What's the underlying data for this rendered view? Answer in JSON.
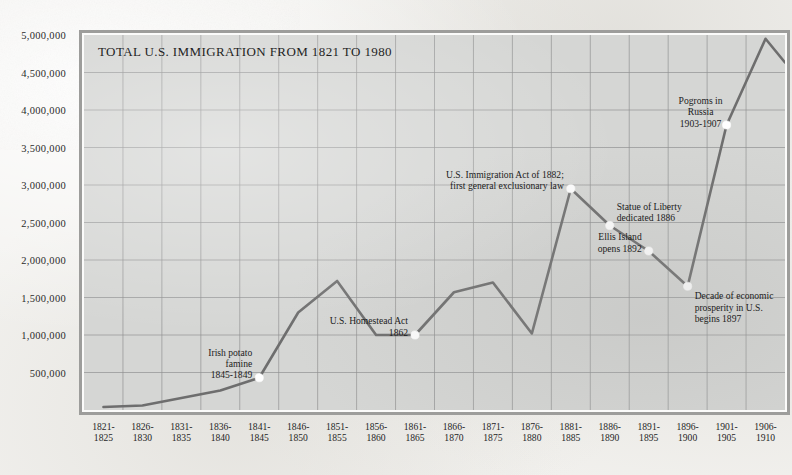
{
  "chart_data": {
    "type": "line",
    "title": "TOTAL U.S. IMMIGRATION FROM 1821 TO 1980",
    "xlabel": "",
    "ylabel": "",
    "ylim": [
      0,
      5000000
    ],
    "grid": true,
    "legend": "none",
    "categories": [
      "1821-\n1825",
      "1826-\n1830",
      "1831-\n1835",
      "1836-\n1840",
      "1841-\n1845",
      "1846-\n1850",
      "1851-\n1855",
      "1856-\n1860",
      "1861-\n1865",
      "1866-\n1870",
      "1871-\n1875",
      "1876-\n1880",
      "1881-\n1885",
      "1886-\n1890",
      "1891-\n1895",
      "1896-\n1900",
      "1901-\n1905",
      "1906-\n1910"
    ],
    "values": [
      40000,
      60000,
      160000,
      260000,
      430000,
      1300000,
      1720000,
      1000000,
      1000000,
      1570000,
      1700000,
      1020000,
      2950000,
      2460000,
      2120000,
      1650000,
      3800000,
      4950000
    ],
    "ytick_labels": [
      "5,000,000",
      "4,500,000",
      "4,000,000",
      "3,500,000",
      "3,000,000",
      "2,500,000",
      "2,000,000",
      "1,500,000",
      "1,000,000",
      "500,000"
    ],
    "ytick_values": [
      5000000,
      4500000,
      4000000,
      3500000,
      3000000,
      2500000,
      2000000,
      1500000,
      1000000,
      500000
    ],
    "annotations": [
      {
        "text": "Irish potato\nfamine\n1845-1849",
        "category_index": 4,
        "value": 430000,
        "align": "right",
        "marker": true
      },
      {
        "text": "U.S. Homestead Act\n1862",
        "category_index": 8,
        "value": 1000000,
        "align": "right",
        "marker": true
      },
      {
        "text": "U.S. Immigration Act of 1882;\nfirst general exclusionary law",
        "category_index": 12,
        "value": 2950000,
        "align": "right",
        "marker": true
      },
      {
        "text": "Statue of Liberty\ndedicated 1886",
        "category_index": 13,
        "value": 2460000,
        "align": "left",
        "marker": true
      },
      {
        "text": "Ellis Island\nopens 1892",
        "category_index": 14,
        "value": 2120000,
        "align": "right",
        "marker": true
      },
      {
        "text": "Decade of economic\nprosperity in U.S.\nbegins 1897",
        "category_index": 15,
        "value": 1650000,
        "align": "left",
        "marker": true
      },
      {
        "text": "Pogroms in\nRussia\n1903-1907",
        "category_index": 16,
        "value": 3800000,
        "align": "center-right",
        "marker": true
      }
    ],
    "colors": {
      "line": "#6e6e6e",
      "plot_background": "#d5d6d4",
      "grid": "#8e9090",
      "frame": "#9d9d9b",
      "paper": "#f2f1ee",
      "text": "#1c1c1c",
      "marker_fill": "#ffffff"
    }
  }
}
